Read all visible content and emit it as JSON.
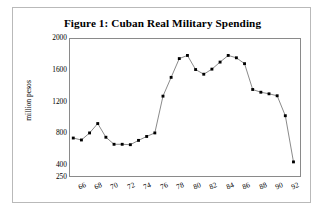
{
  "figure": {
    "title": "Figure 1: Cuban Real Military Spending"
  },
  "chart_data": {
    "type": "line",
    "title": "Figure 1: Cuban Real Military Spending",
    "xlabel": "",
    "ylabel": "million pesos",
    "marker": "filled-square",
    "grid": false,
    "legend": "none",
    "xlim": [
      64.6,
      92.8
    ],
    "ylim": [
      250,
      2000
    ],
    "yticks": [
      2000,
      1600,
      1200,
      800,
      400,
      250
    ],
    "ytick_labels": [
      "2000",
      "1600",
      "1200",
      "800",
      "400",
      "250"
    ],
    "xticks": [
      66,
      68,
      70,
      72,
      74,
      76,
      78,
      80,
      82,
      84,
      86,
      88,
      90,
      92
    ],
    "xtick_labels": [
      "66",
      "68",
      "70",
      "72",
      "74",
      "76",
      "78",
      "80",
      "82",
      "84",
      "86",
      "88",
      "90",
      "92"
    ],
    "x": [
      65,
      66,
      67,
      68,
      69,
      70,
      71,
      72,
      73,
      74,
      75,
      76,
      77,
      78,
      79,
      80,
      81,
      82,
      83,
      84,
      85,
      86,
      87,
      88,
      89,
      90,
      91,
      92
    ],
    "values": [
      735,
      710,
      800,
      920,
      745,
      655,
      655,
      650,
      705,
      755,
      800,
      1270,
      1510,
      1750,
      1790,
      1610,
      1550,
      1615,
      1705,
      1790,
      1760,
      1685,
      1355,
      1320,
      1300,
      1275,
      1020,
      430
    ],
    "series": [
      {
        "name": "Cuban real military spending",
        "values": [
          735,
          710,
          800,
          920,
          745,
          655,
          655,
          650,
          705,
          755,
          800,
          1270,
          1510,
          1750,
          1790,
          1610,
          1550,
          1615,
          1705,
          1790,
          1760,
          1685,
          1355,
          1320,
          1300,
          1275,
          1020,
          430
        ]
      }
    ],
    "colors": {
      "line": "#555555",
      "marker": "#000000",
      "axis": "#8a8a8a",
      "text": "#000000"
    }
  }
}
